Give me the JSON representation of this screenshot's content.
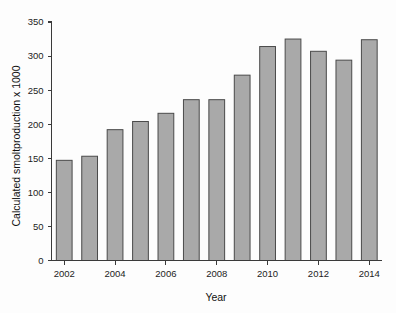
{
  "chart_data": {
    "type": "bar",
    "title": "",
    "subtitle": "",
    "xlabel": "Year",
    "ylabel": "Calculated smoltproduction x 1000",
    "categories": [
      2002,
      2003,
      2004,
      2005,
      2006,
      2007,
      2008,
      2009,
      2010,
      2011,
      2012,
      2013,
      2014
    ],
    "values": [
      147,
      153,
      192,
      204,
      216,
      236,
      236,
      272,
      314,
      325,
      307,
      294,
      324
    ],
    "series": [
      {
        "name": "Calculated smoltproduction x 1000",
        "values": [
          147,
          153,
          192,
          204,
          216,
          236,
          236,
          272,
          314,
          325,
          307,
          294,
          324
        ]
      }
    ],
    "ylim": [
      0,
      350
    ],
    "yticks": [
      0,
      50,
      100,
      150,
      200,
      250,
      300,
      350
    ],
    "ytick_labels": [
      "0",
      "50",
      "100",
      "150",
      "200",
      "250",
      "300",
      "350"
    ],
    "xtick_values": [
      2002,
      2004,
      2006,
      2008,
      2010,
      2012,
      2014
    ],
    "xtick_labels": [
      "2002",
      "2004",
      "2006",
      "2008",
      "2010",
      "2012",
      "2014"
    ],
    "grid": false,
    "legend": false,
    "legend_position": "none",
    "bar_color": "#a9a9a9",
    "bar_edge_color": "#4a4a4a",
    "axis_color": "#3a3a3a",
    "background_color": "#fdfdfd"
  }
}
